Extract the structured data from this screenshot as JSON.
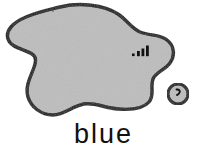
{
  "figure": {
    "caption": "blue",
    "background_color": "#ffffff",
    "outline_color": "#111111",
    "fill_color": "#bdbdbd",
    "shapes": [
      {
        "name": "main-blob",
        "kind": "amoeba",
        "fill": "#bdbdbd",
        "stroke": "#111111",
        "stroke_width": 3.4
      },
      {
        "name": "satellite-blob",
        "kind": "circle",
        "fill": "#bdbdbd",
        "stroke": "#111111",
        "stroke_width": 3.0,
        "cx": 178,
        "cy": 94,
        "r": 10
      }
    ],
    "marks": [
      {
        "name": "signal-bars-mark",
        "description": "dot followed by three ascending bars",
        "color": "#111111",
        "bars": [
          3,
          5,
          7
        ],
        "x": 133,
        "y": 47
      },
      {
        "name": "comma-mark",
        "description": "small hooked comma stroke inside satellite blob",
        "color": "#111111",
        "x": 178,
        "y": 90
      },
      {
        "name": "speck-mark",
        "description": "tiny ink speck near top edge",
        "color": "#6a6a6a",
        "x": 53,
        "y": 11
      }
    ]
  }
}
